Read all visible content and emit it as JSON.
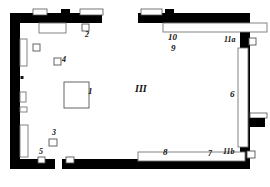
{
  "figure": {
    "kind": "architectural-floor-plan",
    "width": 270,
    "height": 187,
    "colors": {
      "wall": "#000000",
      "background": "#ffffff",
      "feature_outline": "#888888",
      "label": "#111111"
    }
  },
  "labels": [
    {
      "id": "label-1",
      "text": "1",
      "x": 88,
      "y": 92,
      "size": "lbl-md"
    },
    {
      "id": "label-2",
      "text": "2",
      "x": 85,
      "y": 34,
      "size": "lbl-sm"
    },
    {
      "id": "label-3",
      "text": "3",
      "x": 52,
      "y": 130,
      "size": "lbl-sm"
    },
    {
      "id": "label-4",
      "text": "4",
      "x": 63,
      "y": 59,
      "size": "lbl-sm"
    },
    {
      "id": "label-5",
      "text": "5",
      "x": 40,
      "y": 156,
      "size": "lbl-sm"
    },
    {
      "id": "label-6",
      "text": "6",
      "x": 231,
      "y": 93,
      "size": "lbl-md"
    },
    {
      "id": "label-7",
      "text": "7",
      "x": 209,
      "y": 155,
      "size": "lbl-sm"
    },
    {
      "id": "label-8",
      "text": "8",
      "x": 164,
      "y": 154,
      "size": "lbl-md"
    },
    {
      "id": "label-9",
      "text": "9",
      "x": 172,
      "y": 47,
      "size": "lbl-md"
    },
    {
      "id": "label-10",
      "text": "10",
      "x": 169,
      "y": 35,
      "size": "lbl-md"
    },
    {
      "id": "label-11a",
      "text": "11a",
      "x": 225,
      "y": 39,
      "size": "lbl-sm"
    },
    {
      "id": "label-11b",
      "text": "11b",
      "x": 224,
      "y": 152,
      "size": "lbl-sm"
    },
    {
      "id": "label-room-III",
      "text": "III",
      "x": 136,
      "y": 90,
      "size": "lbl-lg"
    }
  ],
  "walls": {
    "top_left_segment": {
      "x": 10,
      "y": 13,
      "w": 92,
      "h": 10
    },
    "top_right_segment": {
      "x": 138,
      "y": 13,
      "w": 112,
      "h": 10
    },
    "left_wall": {
      "x": 10,
      "y": 13,
      "w": 10,
      "h": 156
    },
    "right_wall": {
      "x": 240,
      "y": 13,
      "w": 10,
      "h": 156
    },
    "bottom_left_segment": {
      "x": 10,
      "y": 159,
      "w": 45,
      "h": 10
    },
    "bottom_right_segment": {
      "x": 62,
      "y": 159,
      "w": 188,
      "h": 10
    },
    "top_gap_doorway": {
      "x": 102,
      "y": 13,
      "w": 36,
      "h": 10
    },
    "bottom_gap_doorway": {
      "x": 55,
      "y": 159,
      "w": 7,
      "h": 10
    }
  },
  "pier_blocks": [
    {
      "id": "pier-top-left",
      "x": 61,
      "y": 10,
      "w": 9,
      "h": 8
    },
    {
      "id": "pier-top-right",
      "x": 165,
      "y": 10,
      "w": 9,
      "h": 8
    }
  ],
  "outer_features": [
    {
      "id": "outer-box-top-a",
      "x": 33,
      "y": 10,
      "w": 13,
      "h": 6
    },
    {
      "id": "outer-box-top-b",
      "x": 80,
      "y": 10,
      "w": 22,
      "h": 6
    },
    {
      "id": "outer-box-top-c",
      "x": 141,
      "y": 10,
      "w": 20,
      "h": 6
    }
  ],
  "inner_features": [
    {
      "id": "bench-top-left",
      "x": 39,
      "y": 23,
      "w": 26,
      "h": 9
    },
    {
      "id": "niche-left-upper",
      "x": 20,
      "y": 39,
      "w": 7,
      "h": 26
    },
    {
      "id": "niche-left-mid",
      "x": 20,
      "y": 92,
      "w": 5,
      "h": 10
    },
    {
      "id": "niche-left-low",
      "x": 20,
      "y": 107,
      "w": 6,
      "h": 5
    },
    {
      "id": "niche-left-bottom",
      "x": 20,
      "y": 125,
      "w": 7,
      "h": 32
    },
    {
      "id": "bench-10-9",
      "x": 163,
      "y": 23,
      "w": 103,
      "h": 9
    },
    {
      "id": "bench-6-right",
      "x": 239,
      "y": 48,
      "w": 9,
      "h": 98
    },
    {
      "id": "bench-8-7-bottom",
      "x": 138,
      "y": 152,
      "w": 106,
      "h": 9
    }
  ],
  "find_squares": [
    {
      "id": "find-square-2",
      "x": 82,
      "y": 24,
      "s": 7
    },
    {
      "id": "find-square-left-upper",
      "x": 33,
      "y": 44,
      "s": 7
    },
    {
      "id": "find-square-4",
      "x": 54,
      "y": 58,
      "s": 7
    },
    {
      "id": "find-square-1",
      "x": 63,
      "y": 82,
      "s": 25
    },
    {
      "id": "find-square-3",
      "x": 49,
      "y": 139,
      "s": 7
    },
    {
      "id": "find-square-5",
      "x": 38,
      "y": 157,
      "s": 6
    },
    {
      "id": "find-square-bottom-mid",
      "x": 66,
      "y": 157,
      "s": 7
    },
    {
      "id": "find-square-11a",
      "x": 248,
      "y": 39,
      "s": 7
    },
    {
      "id": "find-square-11b",
      "x": 246,
      "y": 152,
      "s": 7
    }
  ],
  "wall_dots": [
    {
      "id": "wall-dot-left",
      "x": 21,
      "y": 76,
      "w": 3,
      "h": 3
    }
  ],
  "right_opening": {
    "id": "right-wall-opening",
    "notch": {
      "x": 250,
      "y": 114,
      "w": 16,
      "h": 5
    },
    "tab": {
      "x": 250,
      "y": 119,
      "w": 14,
      "h": 8
    }
  }
}
